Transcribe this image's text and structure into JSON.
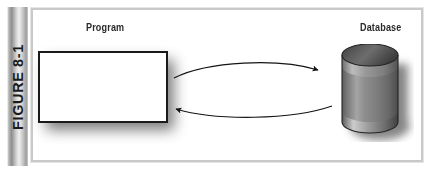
{
  "figure": {
    "spine_label": "FIGURE 8-1",
    "background_color": "#ffffff",
    "frame_border_color": "#c9c9c9"
  },
  "diagram": {
    "type": "flow-diagram",
    "nodes": [
      {
        "id": "program",
        "label": "Program",
        "shape": "rectangle",
        "fill_color": "#ffffff",
        "border_color": "#1a1a1a"
      },
      {
        "id": "database",
        "label": "Database",
        "shape": "cylinder",
        "fill_color": "#8a8a8a",
        "border_color": "#2b2b2b"
      }
    ],
    "connections": [
      {
        "id": "program-to-database",
        "from": "program",
        "to": "database",
        "style": "curved-arrow",
        "direction": "right",
        "color": "#1a1a1a"
      },
      {
        "id": "database-to-program",
        "from": "database",
        "to": "program",
        "style": "curved-arrow",
        "direction": "left",
        "color": "#1a1a1a"
      }
    ]
  },
  "icons": {
    "cylinder": "database-cylinder-icon",
    "arrow_right": "arrow-right-icon",
    "arrow_left": "arrow-left-icon"
  }
}
